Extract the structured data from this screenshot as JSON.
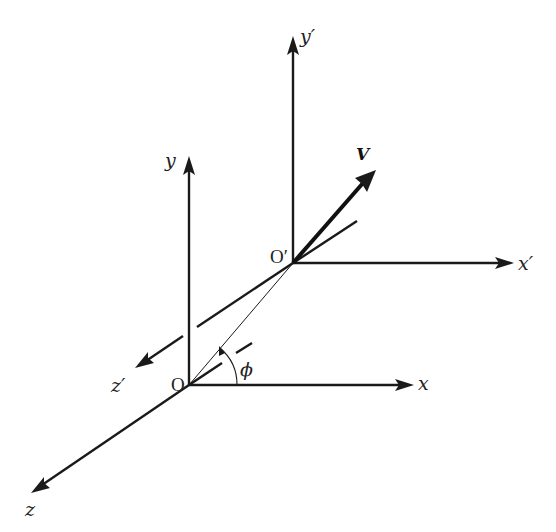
{
  "diagram": {
    "colors": {
      "stroke": "#1a1a1a",
      "background": "#ffffff"
    },
    "frame_O": {
      "origin_label": "O",
      "x_label": "x",
      "y_label": "y",
      "z_label": "z"
    },
    "frame_O_prime": {
      "origin_label": "O′",
      "x_label": "x′",
      "y_label": "y′",
      "z_label": "z′"
    },
    "vector": {
      "label": "V"
    },
    "angle": {
      "label": "ϕ"
    }
  }
}
